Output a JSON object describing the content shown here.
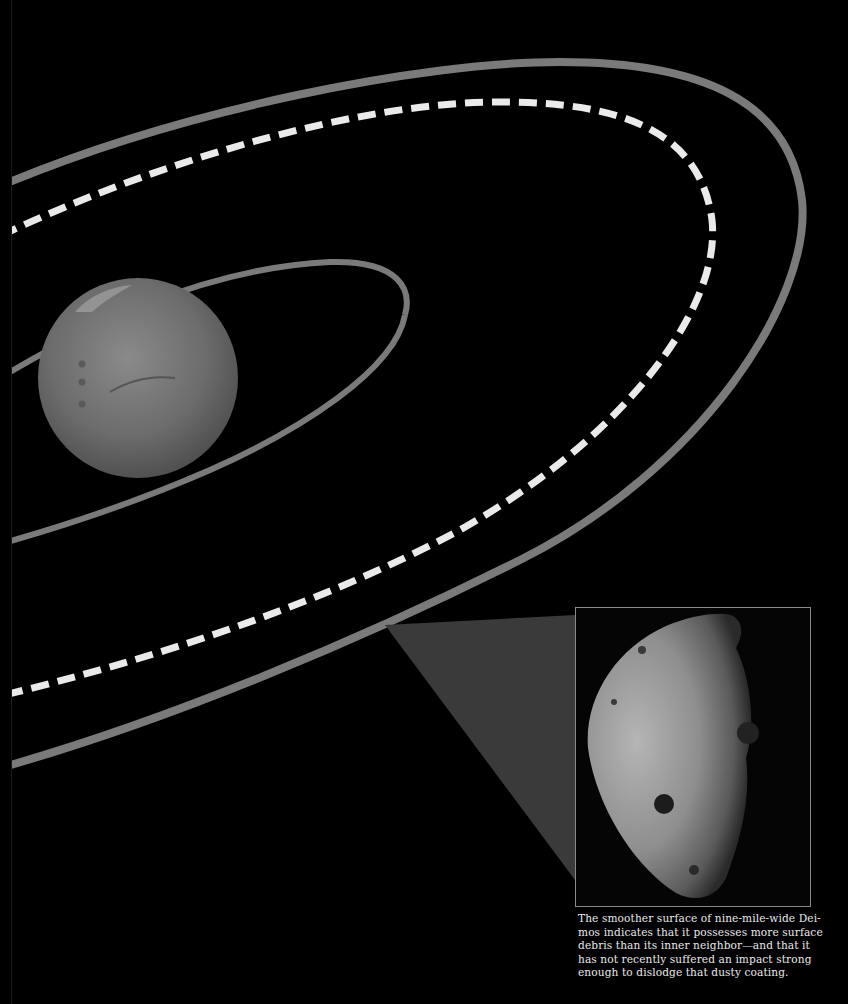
{
  "figure": {
    "colors": {
      "background": "#000000",
      "orbit_band": "#7a7a7a",
      "dashed_orbit": "#e6e6e6",
      "mars": "#6e6e6e",
      "wedge": "#3a3a3a",
      "inset_border": "#8a8a8a",
      "caption_text": "#e8e8e8"
    },
    "elements": {
      "mars_globe": "mars-globe",
      "inner_orbit": "phobos-orbit",
      "dashed_orbit": "synchronous-orbit-dashed",
      "outer_orbit": "deimos-orbit",
      "inset_image": "deimos-closeup"
    }
  },
  "caption": {
    "lines": [
      "The smoother surface of nine-mile-wide Dei-",
      "mos indicates that it possesses more surface",
      "debris than its inner neighbor—and that it",
      "has not recently suffered an impact strong",
      "enough to dislodge that dusty coating."
    ]
  }
}
